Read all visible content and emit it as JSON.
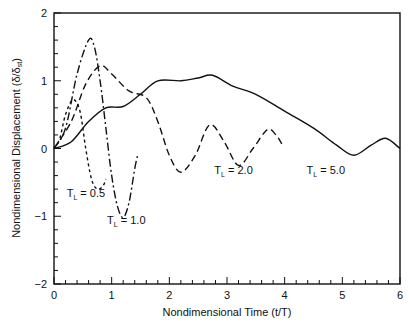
{
  "chart_data": {
    "type": "line",
    "title": "",
    "xlabel": "Nondimensional Time (t/T)",
    "ylabel": "Nondimensional Displacement (δ/δst)",
    "xlim": [
      0,
      6
    ],
    "ylim": [
      -2,
      2
    ],
    "xticks": [
      "0",
      "1",
      "2",
      "3",
      "4",
      "5",
      "6"
    ],
    "yticks": [
      "2",
      "1",
      "0",
      "−1",
      "−2"
    ],
    "grid": false,
    "legend": "inline annotations",
    "series": [
      {
        "name": "T_L = 0.5",
        "style": "dotted",
        "points": [
          [
            0,
            0
          ],
          [
            0.1,
            0.15
          ],
          [
            0.2,
            0.5
          ],
          [
            0.33,
            0.72
          ],
          [
            0.45,
            0.55
          ],
          [
            0.55,
            0.0
          ],
          [
            0.65,
            -0.45
          ],
          [
            0.75,
            -0.6
          ],
          [
            0.85,
            -0.55
          ],
          [
            0.9,
            -0.45
          ]
        ]
      },
      {
        "name": "T_L = 1.0",
        "style": "dash-dot",
        "points": [
          [
            0,
            0
          ],
          [
            0.2,
            0.3
          ],
          [
            0.4,
            1.1
          ],
          [
            0.6,
            1.6
          ],
          [
            0.7,
            1.5
          ],
          [
            0.8,
            1.0
          ],
          [
            0.9,
            0.3
          ],
          [
            1.0,
            -0.4
          ],
          [
            1.1,
            -0.85
          ],
          [
            1.2,
            -1.02
          ],
          [
            1.3,
            -0.8
          ],
          [
            1.4,
            -0.3
          ],
          [
            1.45,
            -0.1
          ]
        ]
      },
      {
        "name": "T_L = 2.0",
        "style": "dashed",
        "points": [
          [
            0,
            0
          ],
          [
            0.3,
            0.4
          ],
          [
            0.55,
            0.95
          ],
          [
            0.8,
            1.22
          ],
          [
            1.0,
            1.1
          ],
          [
            1.3,
            0.85
          ],
          [
            1.6,
            0.75
          ],
          [
            1.8,
            0.4
          ],
          [
            2.0,
            -0.1
          ],
          [
            2.2,
            -0.35
          ],
          [
            2.45,
            -0.1
          ],
          [
            2.7,
            0.35
          ],
          [
            2.95,
            0.1
          ],
          [
            3.2,
            -0.25
          ],
          [
            3.45,
            0.0
          ],
          [
            3.7,
            0.28
          ],
          [
            3.85,
            0.2
          ],
          [
            3.95,
            0.07
          ]
        ]
      },
      {
        "name": "T_L = 5.0",
        "style": "solid",
        "points": [
          [
            0,
            0
          ],
          [
            0.3,
            0.1
          ],
          [
            0.6,
            0.4
          ],
          [
            0.9,
            0.6
          ],
          [
            1.2,
            0.62
          ],
          [
            1.5,
            0.8
          ],
          [
            1.8,
            1.0
          ],
          [
            2.2,
            1.0
          ],
          [
            2.5,
            1.04
          ],
          [
            2.75,
            1.08
          ],
          [
            3.1,
            0.92
          ],
          [
            3.5,
            0.8
          ],
          [
            4.0,
            0.55
          ],
          [
            4.5,
            0.3
          ],
          [
            4.9,
            0.05
          ],
          [
            5.2,
            -0.1
          ],
          [
            5.5,
            0.05
          ],
          [
            5.75,
            0.15
          ],
          [
            6.0,
            0.0
          ]
        ]
      }
    ],
    "annotations": [
      {
        "text": "T",
        "sub": "L",
        "rest": " = 0.5",
        "x": 0.22,
        "y": -0.72
      },
      {
        "text": "T",
        "sub": "L",
        "rest": " = 1.0",
        "x": 0.92,
        "y": -1.12
      },
      {
        "text": "T",
        "sub": "L",
        "rest": " = 2.0",
        "x": 2.78,
        "y": -0.38
      },
      {
        "text": "T",
        "sub": "L",
        "rest": " = 5.0",
        "x": 4.38,
        "y": -0.38
      }
    ]
  }
}
